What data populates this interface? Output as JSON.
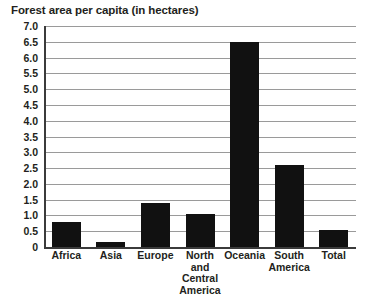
{
  "chart_data": {
    "type": "bar",
    "title": "Forest area per capita (in hectares)",
    "xlabel": "",
    "ylabel": "",
    "categories": [
      "Africa",
      "Asia",
      "Europe",
      "North and Central America",
      "Oceania",
      "South America",
      "Total"
    ],
    "values": [
      0.8,
      0.15,
      1.4,
      1.05,
      6.5,
      2.6,
      0.55
    ],
    "ylim": [
      0,
      7.0
    ],
    "ytick_labels": [
      "7.0",
      "6.5",
      "6.0",
      "5.5",
      "5.0",
      "4.5",
      "4.0",
      "3.5",
      "3.0",
      "2.5",
      "2.0",
      "1.5",
      "1.0",
      "0.5",
      "0"
    ],
    "ytick_values": [
      7.0,
      6.5,
      6.0,
      5.5,
      5.0,
      4.5,
      4.0,
      3.5,
      3.0,
      2.5,
      2.0,
      1.5,
      1.0,
      0.5,
      0
    ],
    "grid": true,
    "legend": "none",
    "series": [
      {
        "name": "Forest area per capita",
        "values": [
          0.8,
          0.15,
          1.4,
          1.05,
          6.5,
          2.6,
          0.55
        ]
      }
    ],
    "category_label_lines": [
      [
        "Africa"
      ],
      [
        "Asia"
      ],
      [
        "Europe"
      ],
      [
        "North",
        "and Central",
        "America"
      ],
      [
        "Oceania"
      ],
      [
        "South",
        "America"
      ],
      [
        "Total"
      ]
    ],
    "colors": {
      "bar": "#111111",
      "gridline": "#9a9a9a",
      "axis": "#3b3b3b",
      "text": "#231f20",
      "background": "#ffffff"
    }
  }
}
